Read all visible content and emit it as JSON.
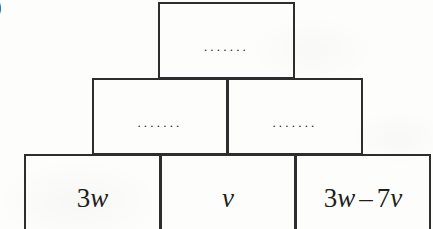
{
  "figure": {
    "kind": "pyramid-wall-diagram",
    "question_label": ")",
    "line_color": "#2d2d2f",
    "text_color": "#1f1f21",
    "background_color": "#fdfdfc"
  },
  "rows": {
    "top": {
      "cells": [
        {
          "name": "top-cell",
          "content": ".......",
          "filled": false
        }
      ]
    },
    "middle": {
      "cells": [
        {
          "name": "middle-left-cell",
          "content": ".......",
          "filled": false
        },
        {
          "name": "middle-right-cell",
          "content": ".......",
          "filled": false
        }
      ]
    },
    "bottom": {
      "cells": [
        {
          "name": "bottom-left-cell",
          "content": "3w",
          "filled": true,
          "parts": {
            "coefficient": "3",
            "variable_1": "w",
            "operator": "",
            "coefficient_2": "",
            "variable_2": ""
          }
        },
        {
          "name": "bottom-middle-cell",
          "content": "v",
          "filled": true,
          "parts": {
            "coefficient": "",
            "variable_1": "v",
            "operator": "",
            "coefficient_2": "",
            "variable_2": ""
          }
        },
        {
          "name": "bottom-right-cell",
          "content": "3w – 7v",
          "filled": true,
          "parts": {
            "coefficient": "3",
            "variable_1": "w",
            "operator": "–",
            "coefficient_2": "7",
            "variable_2": "v"
          }
        }
      ]
    }
  }
}
